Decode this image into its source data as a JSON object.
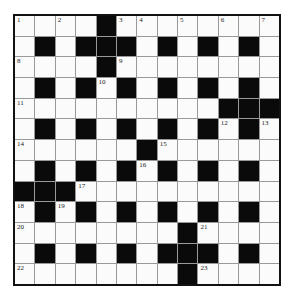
{
  "puzzle": {
    "rows": 13,
    "cols": 13,
    "layout": [
      "....#........",
      ".#.###.#.#.#.",
      "....#........",
      ".#.#.#.#.#.#.",
      "..........###",
      ".#.#.#.#.#.#.",
      "......#......",
      ".#.#.#.#.#.#.",
      "###..........",
      ".#.#.#.#.#.#.",
      "........#....",
      ".#.#.#.###.#.",
      "........#...."
    ],
    "numbers": [
      {
        "r": 0,
        "c": 0,
        "n": "1"
      },
      {
        "r": 0,
        "c": 2,
        "n": "2"
      },
      {
        "r": 0,
        "c": 5,
        "n": "3"
      },
      {
        "r": 0,
        "c": 6,
        "n": "4"
      },
      {
        "r": 0,
        "c": 8,
        "n": "5"
      },
      {
        "r": 0,
        "c": 10,
        "n": "6"
      },
      {
        "r": 0,
        "c": 12,
        "n": "7"
      },
      {
        "r": 2,
        "c": 0,
        "n": "8"
      },
      {
        "r": 2,
        "c": 5,
        "n": "9"
      },
      {
        "r": 3,
        "c": 4,
        "n": "10"
      },
      {
        "r": 4,
        "c": 0,
        "n": "11"
      },
      {
        "r": 5,
        "c": 10,
        "n": "12"
      },
      {
        "r": 5,
        "c": 12,
        "n": "13"
      },
      {
        "r": 6,
        "c": 0,
        "n": "14"
      },
      {
        "r": 6,
        "c": 7,
        "n": "15"
      },
      {
        "r": 7,
        "c": 6,
        "n": "16"
      },
      {
        "r": 8,
        "c": 3,
        "n": "17"
      },
      {
        "r": 9,
        "c": 0,
        "n": "18"
      },
      {
        "r": 9,
        "c": 2,
        "n": "19"
      },
      {
        "r": 10,
        "c": 0,
        "n": "20"
      },
      {
        "r": 10,
        "c": 9,
        "n": "21"
      },
      {
        "r": 12,
        "c": 0,
        "n": "22"
      },
      {
        "r": 12,
        "c": 9,
        "n": "23"
      }
    ]
  }
}
